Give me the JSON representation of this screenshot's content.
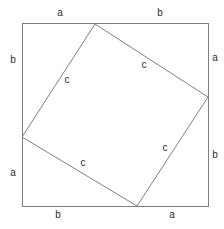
{
  "figure": {
    "background_color": "#ffffff",
    "stroke_color": "#808080",
    "stroke_width": 1,
    "text_color": "#2b2b2b",
    "canvas": {
      "width": 224,
      "height": 229
    }
  },
  "outer_square": {
    "name": "outer-square",
    "left": 22,
    "top": 23,
    "right": 208,
    "bottom": 206,
    "width": 186,
    "height": 183,
    "side_label_parts": [
      "a",
      "b"
    ]
  },
  "inner_square": {
    "name": "inner-square",
    "side_label": "c",
    "vertices": [
      {
        "name": "top-vertex",
        "x": 95,
        "y": 24
      },
      {
        "name": "right-vertex",
        "x": 208,
        "y": 97
      },
      {
        "name": "bottom-vertex",
        "x": 137,
        "y": 206
      },
      {
        "name": "left-vertex",
        "x": 22,
        "y": 137
      }
    ],
    "points_attr": "95,24 208,97 137,206 22,137"
  },
  "labels": {
    "outer": [
      {
        "id": "top-left-a",
        "text": "a",
        "x": 60,
        "y": 13,
        "side": "top",
        "segment": "left"
      },
      {
        "id": "top-right-b",
        "text": "b",
        "x": 160,
        "y": 13,
        "side": "top",
        "segment": "right"
      },
      {
        "id": "right-top-a",
        "text": "a",
        "x": 215,
        "y": 58,
        "side": "right",
        "segment": "top"
      },
      {
        "id": "right-bottom-b",
        "text": "b",
        "x": 215,
        "y": 155,
        "side": "right",
        "segment": "bottom"
      },
      {
        "id": "bottom-left-b",
        "text": "b",
        "x": 58,
        "y": 215,
        "side": "bottom",
        "segment": "left"
      },
      {
        "id": "bottom-right-a",
        "text": "a",
        "x": 172,
        "y": 215,
        "side": "bottom",
        "segment": "right"
      },
      {
        "id": "left-top-b",
        "text": "b",
        "x": 13,
        "y": 60,
        "side": "left",
        "segment": "top"
      },
      {
        "id": "left-bottom-a",
        "text": "a",
        "x": 13,
        "y": 173,
        "side": "left",
        "segment": "bottom"
      }
    ],
    "inner": [
      {
        "id": "inner-upper-left-c",
        "text": "c",
        "x": 67,
        "y": 80,
        "edge": "left-to-top"
      },
      {
        "id": "inner-upper-right-c",
        "text": "c",
        "x": 144,
        "y": 65,
        "edge": "top-to-right"
      },
      {
        "id": "inner-lower-left-c",
        "text": "c",
        "x": 83,
        "y": 163,
        "edge": "left-to-bottom"
      },
      {
        "id": "inner-lower-right-c",
        "text": "c",
        "x": 165,
        "y": 148,
        "edge": "bottom-to-right"
      }
    ]
  }
}
